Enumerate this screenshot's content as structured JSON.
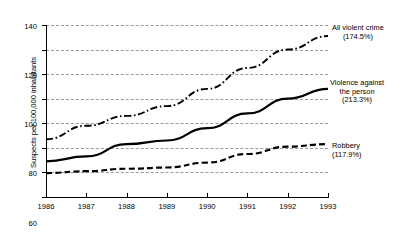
{
  "chart_data": {
    "type": "line",
    "title": "",
    "xlabel": "",
    "ylabel": "Suspects per 100,000 inhabitants",
    "categories": [
      "1986",
      "1987",
      "1988",
      "1989",
      "1990",
      "1991",
      "1992",
      "1993"
    ],
    "x": [
      1986,
      1987,
      1988,
      1989,
      1990,
      1991,
      1992,
      1993
    ],
    "ylim": [
      0,
      140
    ],
    "yticks": [
      0,
      20,
      40,
      60,
      80,
      100,
      120,
      140
    ],
    "grid": "horizontal-dashed",
    "legend_position": "right-of-lines-inline",
    "series": [
      {
        "name": "All violent crime",
        "change_label": "(174.5%)",
        "style": "dash-dot",
        "color": "#000000",
        "values": [
          47,
          58,
          66,
          74,
          88,
          105,
          120,
          131
        ]
      },
      {
        "name": "Violence against the person",
        "change_label": "(213.3%)",
        "style": "solid",
        "color": "#000000",
        "values": [
          29,
          33,
          43,
          46,
          56,
          68,
          80,
          88
        ]
      },
      {
        "name": "Robbery",
        "change_label": "(117.9%)",
        "style": "dashed",
        "color": "#000000",
        "values": [
          19.5,
          21,
          23,
          24,
          28,
          35,
          41,
          43
        ]
      }
    ],
    "annotations": [
      {
        "id": "all-violent-crime",
        "line1": "All violent crime",
        "line2": "(174.5%)",
        "line3": ""
      },
      {
        "id": "violence-person",
        "line1": "Violence against",
        "line2": "the person",
        "line3": "(213.3%)"
      },
      {
        "id": "robbery",
        "line1": "Robbery",
        "line2": "(117.9%)",
        "line3": ""
      }
    ]
  },
  "axis": {
    "y_title": "Suspects per 100,000 inhabitants",
    "y_tick_labels": [
      "140",
      "120",
      "100",
      "80",
      "60",
      "40",
      "20",
      "0"
    ],
    "x_tick_labels": [
      "1986",
      "1987",
      "1988",
      "1989",
      "1990",
      "1991",
      "1992",
      "1993"
    ]
  },
  "colors": {
    "axis": "#000000",
    "grid": "#9a9a9a",
    "series": "#000000",
    "background": "#ffffff"
  }
}
